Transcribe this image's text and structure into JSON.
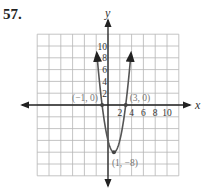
{
  "problem": {
    "number": "57."
  },
  "chart_data": {
    "type": "line",
    "title": "",
    "xlabel": "x",
    "ylabel": "y",
    "xlim": [
      -12,
      12
    ],
    "ylim": [
      -12,
      12
    ],
    "grid": true,
    "grid_step": 2,
    "x_tick_labels": [
      "2",
      "4",
      "6",
      "8",
      "10"
    ],
    "y_tick_labels": [
      "2",
      "4",
      "6",
      "8",
      "10"
    ],
    "series": [
      {
        "name": "parabola",
        "equation": "y = 2(x + 1)(x - 3)",
        "x": [
          -1.9,
          -1.5,
          -1,
          -0.5,
          0,
          0.5,
          1,
          1.5,
          2,
          2.5,
          3,
          3.5,
          3.9
        ],
        "values": [
          11.02,
          4.5,
          0,
          -3.5,
          -6,
          -7.5,
          -8,
          -7.5,
          -6,
          -3.5,
          0,
          4.5,
          11.02
        ]
      }
    ],
    "annotations": [
      {
        "label": "(−1, 0)",
        "x": -1,
        "y": 0
      },
      {
        "label": "(3, 0)",
        "x": 3,
        "y": 0
      },
      {
        "label": "(1, −8)",
        "x": 1,
        "y": -8
      }
    ]
  }
}
